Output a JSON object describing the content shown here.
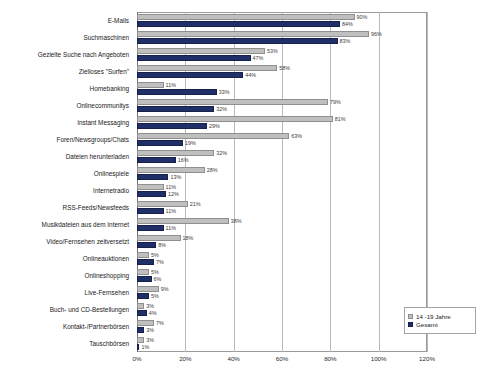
{
  "chart_data": {
    "type": "bar",
    "orientation": "horizontal",
    "title": "",
    "xlabel": "",
    "ylabel": "",
    "xlim": [
      0,
      120
    ],
    "xticks": [
      "0%",
      "20%",
      "40%",
      "60%",
      "80%",
      "100%",
      "120%"
    ],
    "xtick_values": [
      0,
      20,
      40,
      60,
      80,
      100,
      120
    ],
    "grid": true,
    "legend_position": "bottom-right",
    "categories": [
      "E-Mails",
      "Suchmaschinen",
      "Gezielte Suche nach Angeboten",
      "Zielloses \"Surfen\"",
      "Homebanking",
      "Onlinecommunitys",
      "Instant Messaging",
      "Foren/Newsgroups/Chats",
      "Dateien herunterladen",
      "Onlinespiele",
      "Internetradio",
      "RSS-Feeds/Newsfeeds",
      "Musikdateien aus dem Internet",
      "Video/Fernsehen zeitversetzt",
      "Onlineauktionen",
      "Onlineshopping",
      "Live-Fernsehen",
      "Buch- und CD-Bestellungen",
      "Kontakt-/Partnerbörsen",
      "Tauschbörsen"
    ],
    "series": [
      {
        "name": "14 -19 Jahre",
        "color": "#bfbfbf",
        "values": [
          90,
          96,
          53,
          58,
          11,
          79,
          81,
          63,
          32,
          28,
          11,
          21,
          38,
          18,
          5,
          5,
          9,
          3,
          7,
          3
        ],
        "labels": [
          "90%",
          "96%",
          "53%",
          "58%",
          "11%",
          "79%",
          "81%",
          "63%",
          "32%",
          "28%",
          "11%",
          "21%",
          "38%",
          "18%",
          "5%",
          "5%",
          "9%",
          "3%",
          "7%",
          "3%"
        ]
      },
      {
        "name": "Gesamt",
        "color": "#1f2f68",
        "values": [
          84,
          83,
          47,
          44,
          33,
          32,
          29,
          19,
          16,
          13,
          12,
          11,
          11,
          8,
          7,
          6,
          5,
          4,
          3,
          1
        ],
        "labels": [
          "84%",
          "83%",
          "47%",
          "44%",
          "33%",
          "32%",
          "29%",
          "19%",
          "16%",
          "13%",
          "12%",
          "11%",
          "11%",
          "8%",
          "7%",
          "6%",
          "5%",
          "4%",
          "3%",
          "1%"
        ]
      }
    ]
  },
  "legend": {
    "items": [
      {
        "label": "14 -19 Jahre"
      },
      {
        "label": "Gesamt"
      }
    ]
  }
}
